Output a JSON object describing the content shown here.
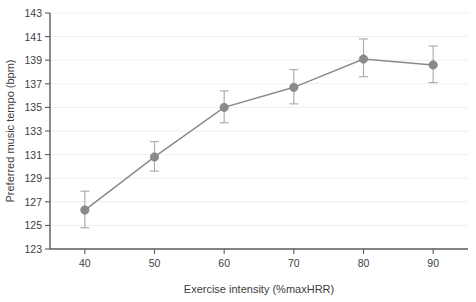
{
  "chart_data": {
    "type": "line",
    "title": "",
    "xlabel": "Exercise intensity (%maxHRR)",
    "ylabel": "Preferred music tempo (bpm)",
    "x": [
      40,
      50,
      60,
      70,
      80,
      90
    ],
    "values": [
      126.3,
      130.8,
      135.0,
      136.7,
      139.1,
      138.6
    ],
    "error_low": [
      124.8,
      129.6,
      133.7,
      135.3,
      137.6,
      137.1
    ],
    "error_high": [
      127.9,
      132.1,
      136.4,
      138.2,
      140.8,
      140.2
    ],
    "xticklabels": [
      "40",
      "50",
      "60",
      "70",
      "80",
      "90"
    ],
    "yticklabels": [
      "123",
      "125",
      "127",
      "129",
      "131",
      "133",
      "135",
      "137",
      "139",
      "141",
      "143"
    ],
    "yticks": [
      123,
      125,
      127,
      129,
      131,
      133,
      135,
      137,
      139,
      141,
      143
    ],
    "xlim": [
      35,
      95
    ],
    "ylim": [
      123,
      143
    ],
    "grid": "horizontal",
    "legend": "none",
    "series_color": "#8a8a8a",
    "errorbar_color": "#a8a8a8",
    "axis_color": "#5a5a5a",
    "grid_color": "#ececec",
    "text_color": "#3d3d3d",
    "background": "#ffffff"
  }
}
